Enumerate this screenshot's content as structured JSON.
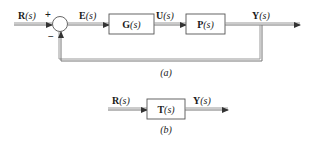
{
  "diagram_a": {
    "caption": "(a)",
    "input": {
      "name": "R",
      "arg": "(s)"
    },
    "summing_junction": {
      "plus": "+",
      "minus": "−"
    },
    "error": {
      "name": "E",
      "arg": "(s)"
    },
    "controller": {
      "name": "G",
      "arg": "(s)"
    },
    "control_signal": {
      "name": "U",
      "arg": "(s)"
    },
    "plant": {
      "name": "P",
      "arg": "(s)"
    },
    "output": {
      "name": "Y",
      "arg": "(s)"
    }
  },
  "diagram_b": {
    "caption": "(b)",
    "input": {
      "name": "R",
      "arg": "(s)"
    },
    "transfer": {
      "name": "T",
      "arg": "(s)"
    },
    "output": {
      "name": "Y",
      "arg": "(s)"
    }
  },
  "colors": {
    "line": "#777777",
    "text": "#1a1a1a",
    "background": "#ffffff"
  }
}
